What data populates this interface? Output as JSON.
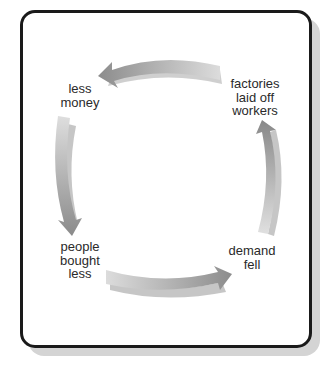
{
  "diagram": {
    "type": "cycle",
    "direction": "clockwise-reversed",
    "nodes": [
      {
        "id": "factories",
        "label": "factories\nlaid off\nworkers",
        "lines": [
          "factories",
          "laid off",
          "workers"
        ],
        "position": "top-right"
      },
      {
        "id": "less_money",
        "label": "less\nmoney",
        "lines": [
          "less",
          "money"
        ],
        "position": "top-left"
      },
      {
        "id": "people_bought_less",
        "label": "people\nbought\nless",
        "lines": [
          "people",
          "bought",
          "less"
        ],
        "position": "bottom-left"
      },
      {
        "id": "demand_fell",
        "label": "demand\nfell",
        "lines": [
          "demand",
          "fell"
        ],
        "position": "bottom-right"
      }
    ],
    "edges": [
      {
        "from": "factories",
        "to": "less_money"
      },
      {
        "from": "less_money",
        "to": "people_bought_less"
      },
      {
        "from": "people_bought_less",
        "to": "demand_fell"
      },
      {
        "from": "demand_fell",
        "to": "factories"
      }
    ]
  },
  "colors": {
    "frame_border": "#1a1a1a",
    "shadow": "#d4d4d4",
    "arrow_dark": "#8f8f8f",
    "arrow_light": "#d9d9d9",
    "text": "#2a2a2a"
  }
}
